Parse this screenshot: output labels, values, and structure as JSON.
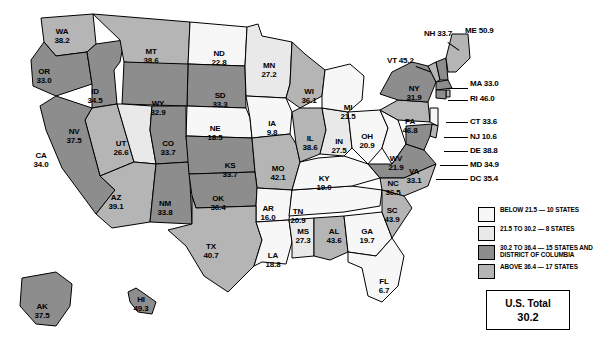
{
  "map": {
    "title": "U.S. state map choropleth",
    "colors": {
      "below_21_5": "#e9e9e9",
      "range_21_5_30_2": "#f7f7f7",
      "range_30_2_36_4": "#8d8d8d",
      "above_36_4": "#b5b5b5",
      "outline": "#000000",
      "background": "#ffffff"
    },
    "states": [
      {
        "abbr": "WA",
        "value": "38.2",
        "x": 62,
        "y": 28,
        "class": "above"
      },
      {
        "abbr": "OR",
        "value": "33.0",
        "x": 44,
        "y": 68,
        "class": "mid"
      },
      {
        "abbr": "ID",
        "value": "34.5",
        "x": 95,
        "y": 88,
        "class": "mid"
      },
      {
        "abbr": "MT",
        "value": "38.6",
        "x": 151,
        "y": 48,
        "class": "above"
      },
      {
        "abbr": "ND",
        "value": "22.8",
        "x": 219,
        "y": 50,
        "class": "low"
      },
      {
        "abbr": "MN",
        "value": "27.2",
        "x": 269,
        "y": 62,
        "class": "low"
      },
      {
        "abbr": "WI",
        "value": "36.1",
        "x": 309,
        "y": 88,
        "class": "above"
      },
      {
        "abbr": "NV",
        "value": "37.5",
        "x": 74,
        "y": 128,
        "class": "above"
      },
      {
        "abbr": "UT",
        "value": "26.6",
        "x": 121,
        "y": 140,
        "class": "low"
      },
      {
        "abbr": "WY",
        "value": "32.9",
        "x": 158,
        "y": 100,
        "class": "mid"
      },
      {
        "abbr": "SD",
        "value": "33.3",
        "x": 220,
        "y": 92,
        "class": "mid"
      },
      {
        "abbr": "NE",
        "value": "18.5",
        "x": 215,
        "y": 125,
        "class": "low"
      },
      {
        "abbr": "IA",
        "value": "9.8",
        "x": 272,
        "y": 120,
        "class": "low"
      },
      {
        "abbr": "CO",
        "value": "33.7",
        "x": 168,
        "y": 140,
        "class": "mid"
      },
      {
        "abbr": "CA",
        "value": "34.0",
        "x": 41,
        "y": 152,
        "class": "mid"
      },
      {
        "abbr": "AZ",
        "value": "39.1",
        "x": 116,
        "y": 194,
        "class": "above"
      },
      {
        "abbr": "NM",
        "value": "33.8",
        "x": 165,
        "y": 200,
        "class": "mid"
      },
      {
        "abbr": "KS",
        "value": "33.7",
        "x": 230,
        "y": 162,
        "class": "mid"
      },
      {
        "abbr": "MO",
        "value": "42.1",
        "x": 278,
        "y": 165,
        "class": "above"
      },
      {
        "abbr": "OK",
        "value": "36.4",
        "x": 218,
        "y": 195,
        "class": "mid"
      },
      {
        "abbr": "AR",
        "value": "16.0",
        "x": 268,
        "y": 205,
        "class": "low"
      },
      {
        "abbr": "TX",
        "value": "40.7",
        "x": 211,
        "y": 243,
        "class": "above"
      },
      {
        "abbr": "LA",
        "value": "18.8",
        "x": 273,
        "y": 252,
        "class": "low"
      },
      {
        "abbr": "MS",
        "value": "27.3",
        "x": 303,
        "y": 228,
        "class": "low"
      },
      {
        "abbr": "AL",
        "value": "43.6",
        "x": 334,
        "y": 228,
        "class": "above"
      },
      {
        "abbr": "GA",
        "value": "19.7",
        "x": 367,
        "y": 228,
        "class": "low"
      },
      {
        "abbr": "FL",
        "value": "6.7",
        "x": 384,
        "y": 278,
        "class": "low"
      },
      {
        "abbr": "SC",
        "value": "43.9",
        "x": 392,
        "y": 207,
        "class": "above"
      },
      {
        "abbr": "NC",
        "value": "36.5",
        "x": 393,
        "y": 180,
        "class": "above"
      },
      {
        "abbr": "TN",
        "value": "20.9",
        "x": 298,
        "y": 208,
        "class": "low"
      },
      {
        "abbr": "KY",
        "value": "19.0",
        "x": 324,
        "y": 175,
        "class": "low"
      },
      {
        "abbr": "IL",
        "value": "38.6",
        "x": 310,
        "y": 135,
        "class": "above"
      },
      {
        "abbr": "IN",
        "value": "27.5",
        "x": 339,
        "y": 138,
        "class": "low"
      },
      {
        "abbr": "OH",
        "value": "20.9",
        "x": 367,
        "y": 133,
        "class": "low"
      },
      {
        "abbr": "MI",
        "value": "21.5",
        "x": 348,
        "y": 104,
        "class": "low"
      },
      {
        "abbr": "WV",
        "value": "21.9",
        "x": 396,
        "y": 155,
        "class": "low"
      },
      {
        "abbr": "VA",
        "value": "33.1",
        "x": 414,
        "y": 168,
        "class": "mid"
      },
      {
        "abbr": "PA",
        "value": "46.8",
        "x": 410,
        "y": 118,
        "class": "above"
      },
      {
        "abbr": "NY",
        "value": "31.9",
        "x": 414,
        "y": 85,
        "class": "mid"
      }
    ],
    "callouts": [
      {
        "abbr": "NH",
        "value": "33.7",
        "x": 424,
        "y": 30,
        "leader": {
          "x": 448,
          "y": 42,
          "w": 14,
          "deg": 35
        }
      },
      {
        "abbr": "ME",
        "value": "50.9",
        "x": 465,
        "y": 27,
        "leader": null
      },
      {
        "abbr": "VT",
        "value": "45.2",
        "x": 387,
        "y": 57,
        "leader": {
          "x": 416,
          "y": 66,
          "w": 16,
          "deg": 20
        }
      },
      {
        "abbr": "MA",
        "value": "33.0",
        "x": 470,
        "y": 80,
        "leader": {
          "x": 448,
          "y": 88,
          "w": 20,
          "deg": 0
        }
      },
      {
        "abbr": "RI",
        "value": "46.0",
        "x": 470,
        "y": 95,
        "leader": {
          "x": 448,
          "y": 100,
          "w": 20,
          "deg": 0
        }
      },
      {
        "abbr": "CT",
        "value": "33.6",
        "x": 470,
        "y": 118,
        "leader": {
          "x": 446,
          "y": 122,
          "w": 22,
          "deg": 0
        }
      },
      {
        "abbr": "NJ",
        "value": "10.6",
        "x": 470,
        "y": 133,
        "leader": {
          "x": 444,
          "y": 137,
          "w": 24,
          "deg": 0
        }
      },
      {
        "abbr": "DE",
        "value": "38.8",
        "x": 470,
        "y": 147,
        "leader": {
          "x": 444,
          "y": 151,
          "w": 24,
          "deg": 0
        }
      },
      {
        "abbr": "MD",
        "value": "34.9",
        "x": 470,
        "y": 161,
        "leader": {
          "x": 440,
          "y": 165,
          "w": 28,
          "deg": 0
        }
      },
      {
        "abbr": "DC",
        "value": "35.4",
        "x": 470,
        "y": 175,
        "leader": {
          "x": 436,
          "y": 179,
          "w": 32,
          "deg": 0
        }
      }
    ],
    "insets": [
      {
        "abbr": "AK",
        "value": "37.5",
        "x": 42,
        "y": 303,
        "class": "mid"
      },
      {
        "abbr": "HI",
        "value": "49.3",
        "x": 141,
        "y": 296,
        "class": "mid"
      }
    ]
  },
  "legend": {
    "items": [
      {
        "swatch": "#f7f7f7",
        "text": "BELOW 21.5 — 10 STATES"
      },
      {
        "swatch": "#e9e9e9",
        "text": "21.5 TO 30.2 — 8 STATES"
      },
      {
        "swatch": "#8d8d8d",
        "text": "30.2 TO 36.4 — 15 STATES AND DISTRICT OF COLUMBIA"
      },
      {
        "swatch": "#b5b5b5",
        "text": "ABOVE 36.4 — 17 STATES"
      }
    ]
  },
  "total_box": {
    "label": "U.S. Total",
    "value": "30.2"
  }
}
